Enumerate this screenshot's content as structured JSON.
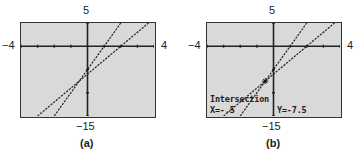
{
  "chart_data": [
    {
      "type": "line",
      "title": "(a)",
      "window": {
        "xmin": -4,
        "xmax": 4,
        "ymin": -15,
        "ymax": 5
      },
      "tick_labels": {
        "top": "5",
        "bottom": "-15",
        "left": "-4",
        "right": "4"
      },
      "x_ticks_step": 1,
      "y_ticks_step": 5,
      "grid": false,
      "series": [
        {
          "name": "y = 5x - 5",
          "slope": 5,
          "intercept": -5,
          "style": "dotted"
        },
        {
          "name": "y = 3x - 6",
          "slope": 3,
          "intercept": -6,
          "style": "dotted"
        }
      ]
    },
    {
      "type": "line",
      "title": "(b)",
      "window": {
        "xmin": -4,
        "xmax": 4,
        "ymin": -15,
        "ymax": 5
      },
      "tick_labels": {
        "top": "5",
        "bottom": "-15",
        "left": "-4",
        "right": "4"
      },
      "x_ticks_step": 1,
      "y_ticks_step": 5,
      "grid": false,
      "series": [
        {
          "name": "y = 5x - 5",
          "slope": 5,
          "intercept": -5,
          "style": "dotted"
        },
        {
          "name": "y = 3x - 6",
          "slope": 3,
          "intercept": -6,
          "style": "dotted"
        }
      ],
      "annotation": {
        "label": "Intersection",
        "x_text": "X=-.5",
        "y_text": "Y=-7.5",
        "x": -0.5,
        "y": -7.5
      }
    }
  ],
  "panels": {
    "a": {
      "caption": "(a)",
      "top": "5",
      "bottom": "−15",
      "left": "−4",
      "right": "4"
    },
    "b": {
      "caption": "(b)",
      "top": "5",
      "bottom": "−15",
      "left": "−4",
      "right": "4",
      "intersection_label": "Intersection",
      "x_readout": "X=-.5",
      "y_readout": "Y=-7.5"
    }
  }
}
